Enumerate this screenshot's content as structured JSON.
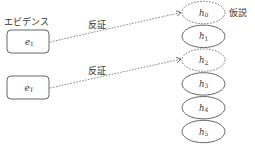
{
  "diagram": {
    "evidence_label": "エビデンス",
    "hypothesis_label": "仮説",
    "evidence_nodes": [
      {
        "base": "e",
        "sub": "1",
        "x": 7,
        "y": 30,
        "w": 42,
        "h": 23
      },
      {
        "base": "e",
        "sub": "T",
        "x": 7,
        "y": 76,
        "w": 42,
        "h": 23
      }
    ],
    "hypothesis_nodes": [
      {
        "base": "h",
        "sub": "0",
        "cy": 12.5,
        "style": "dashed"
      },
      {
        "base": "h",
        "sub": "1",
        "cy": 36.3,
        "style": "solid"
      },
      {
        "base": "h",
        "sub": "2",
        "cy": 60.1,
        "style": "dashed"
      },
      {
        "base": "h",
        "sub": "3",
        "cy": 83.9,
        "style": "solid"
      },
      {
        "base": "h",
        "sub": "4",
        "cy": 107.7,
        "style": "solid"
      },
      {
        "base": "h",
        "sub": "5",
        "cy": 131.5,
        "style": "solid"
      }
    ],
    "edges": [
      {
        "from": "e1",
        "to": "h0",
        "label": "反証",
        "style": "dashed"
      },
      {
        "from": "eT",
        "to": "h2",
        "label": "反証",
        "style": "dashed"
      }
    ],
    "colors": {
      "stroke": "#555555",
      "text": "#333333",
      "background": "#ffffff"
    }
  }
}
